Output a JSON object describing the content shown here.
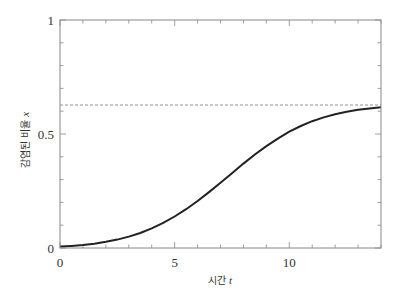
{
  "chart_data": {
    "type": "line",
    "title": "",
    "xlabel": "시간 t",
    "xlabel_text": "시간",
    "xlabel_var": "t",
    "ylabel": "감염된 비율 x",
    "ylabel_text": "감염된 비율",
    "ylabel_var": "x",
    "xlim": [
      0,
      14
    ],
    "ylim": [
      0,
      1
    ],
    "grid": false,
    "legend": null,
    "x_ticks": [
      {
        "value": 0,
        "label": "0"
      },
      {
        "value": 5,
        "label": "5"
      },
      {
        "value": 10,
        "label": "10"
      }
    ],
    "y_ticks": [
      {
        "value": 0,
        "label": "0"
      },
      {
        "value": 0.5,
        "label": "0.5"
      },
      {
        "value": 1,
        "label": "1"
      }
    ],
    "x_minor_step": 1,
    "y_minor_step": 0.1,
    "series": [
      {
        "name": "infected fraction",
        "style": "solid",
        "color": "#222222",
        "x": [
          0,
          0.5,
          1,
          1.5,
          2,
          2.5,
          3,
          3.5,
          4,
          4.5,
          5,
          5.5,
          6,
          6.5,
          7,
          7.5,
          8,
          8.5,
          9,
          9.5,
          10,
          10.5,
          11,
          11.5,
          12,
          12.5,
          13,
          13.5,
          14
        ],
        "y": [
          0.006,
          0.009,
          0.013,
          0.019,
          0.027,
          0.037,
          0.05,
          0.066,
          0.086,
          0.11,
          0.138,
          0.17,
          0.206,
          0.245,
          0.286,
          0.328,
          0.37,
          0.41,
          0.447,
          0.48,
          0.51,
          0.535,
          0.556,
          0.573,
          0.587,
          0.598,
          0.606,
          0.612,
          0.617
        ]
      },
      {
        "name": "asymptote",
        "style": "dashed",
        "color": "#777777",
        "x": [
          0,
          14
        ],
        "y": [
          0.627,
          0.627
        ]
      }
    ]
  }
}
